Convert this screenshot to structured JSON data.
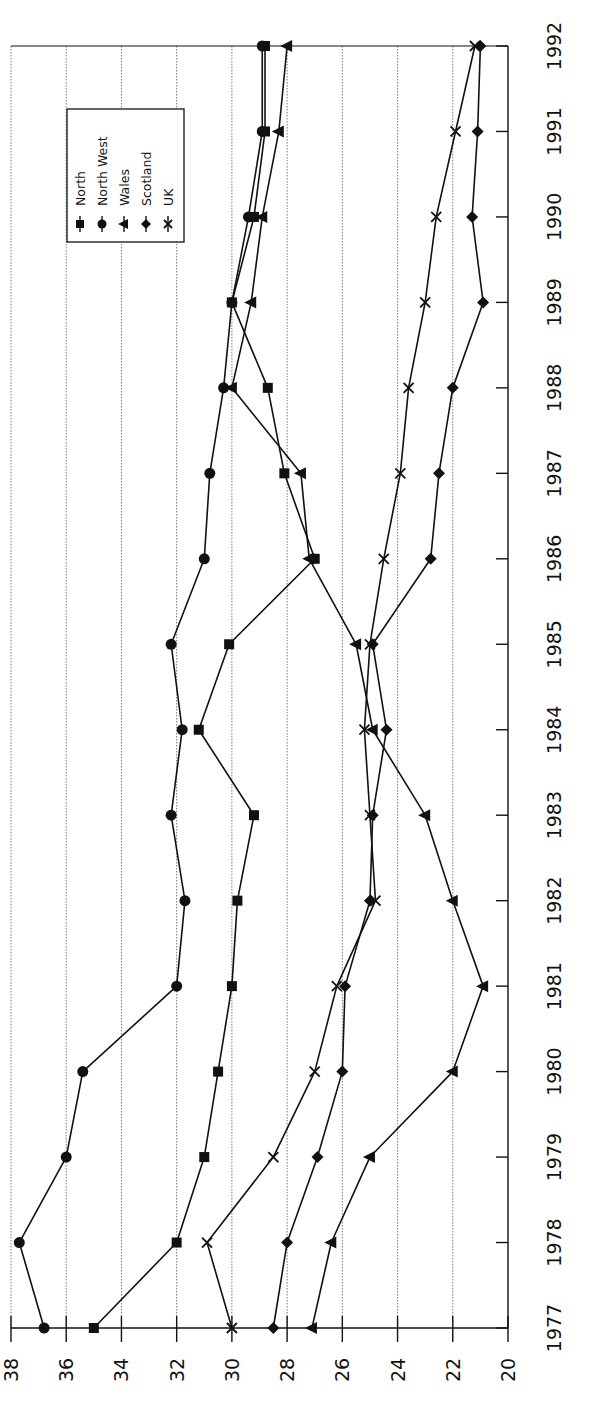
{
  "chart_data": {
    "type": "line",
    "orientation": "rotated-90-ccw",
    "title": "",
    "xlabel": "",
    "ylabel": "",
    "x": [
      1977,
      1978,
      1979,
      1980,
      1981,
      1982,
      1983,
      1984,
      1985,
      1986,
      1987,
      1988,
      1989,
      1990,
      1991,
      1992
    ],
    "ylim": [
      20,
      38
    ],
    "yticks": [
      20,
      22,
      24,
      26,
      28,
      30,
      32,
      34,
      36,
      38
    ],
    "grid": "dotted, at every y tick",
    "legend_position": "upper-left (in rotated view)",
    "series": [
      {
        "name": "North",
        "marker": "square",
        "values": [
          35.0,
          32.0,
          31.0,
          30.5,
          30.0,
          29.8,
          29.2,
          31.2,
          30.1,
          27.0,
          28.1,
          28.7,
          30.0,
          29.2,
          28.8,
          28.8
        ]
      },
      {
        "name": "North West",
        "marker": "circle",
        "values": [
          36.8,
          37.7,
          36.0,
          35.4,
          32.0,
          31.7,
          32.2,
          31.8,
          32.2,
          31.0,
          30.8,
          30.3,
          30.0,
          29.4,
          28.9,
          28.9
        ]
      },
      {
        "name": "Wales",
        "marker": "triangle",
        "values": [
          27.1,
          26.4,
          25.0,
          22.0,
          20.9,
          22.0,
          23.0,
          24.9,
          25.5,
          27.2,
          27.5,
          30.0,
          29.3,
          28.9,
          28.3,
          28.0
        ]
      },
      {
        "name": "Scotland",
        "marker": "diamond",
        "values": [
          28.5,
          28.0,
          26.9,
          26.0,
          25.9,
          25.0,
          24.9,
          24.4,
          24.9,
          22.8,
          22.5,
          22.0,
          20.9,
          21.3,
          21.1,
          21.0
        ]
      },
      {
        "name": "UK",
        "marker": "x",
        "values": [
          30.0,
          30.9,
          28.5,
          27.0,
          26.2,
          24.8,
          25.0,
          25.2,
          25.0,
          24.5,
          23.9,
          23.6,
          23.0,
          22.6,
          21.9,
          21.2
        ]
      }
    ]
  }
}
